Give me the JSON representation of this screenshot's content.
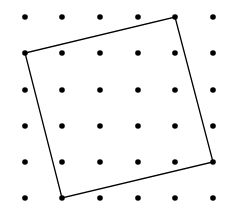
{
  "diagram": {
    "type": "dot-grid-with-tilted-square",
    "grid": {
      "columns": 6,
      "rows": 6,
      "x_positions": [
        25,
        62,
        100,
        138,
        175,
        213
      ],
      "y_positions": [
        17,
        53,
        90,
        126,
        162,
        198
      ],
      "dot_radius": 2.8,
      "dot_color": "#000000"
    },
    "square": {
      "vertices_grid": [
        [
          4,
          0
        ],
        [
          5,
          4
        ],
        [
          1,
          5
        ],
        [
          0,
          1
        ]
      ],
      "stroke_color": "#000000",
      "stroke_width": 1.3
    },
    "background": "#ffffff"
  }
}
